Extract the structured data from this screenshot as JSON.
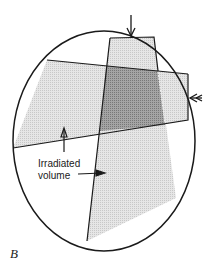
{
  "figure": {
    "panel_letter": "B",
    "label_line1": "Irradiated",
    "label_line2": "volume",
    "colors": {
      "outline": "#1a1a1a",
      "beam_fill": "#e2e2e2",
      "overlap_fill": "#9a9a9a",
      "background": "#ffffff"
    },
    "elements": [
      "body-outline-ellipse",
      "vertical-beam",
      "oblique-horizontal-beam",
      "overlap-region",
      "beam-arrow-top",
      "beam-arrow-right",
      "label-arrow-up",
      "label-arrow-right"
    ]
  }
}
